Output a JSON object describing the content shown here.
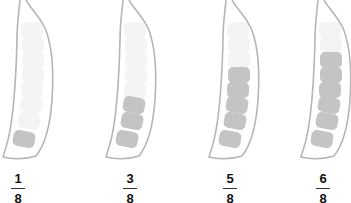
{
  "figure": {
    "colors": {
      "outline": "#b5b5b5",
      "filled_segment": "#c4c4c4",
      "empty_segment": "#f4f4f4",
      "label_text": "#111111"
    },
    "pods": [
      {
        "filled": 1,
        "total": 8,
        "numerator": "1",
        "denominator": "8",
        "offset_x": 0,
        "label_x": 8
      },
      {
        "filled": 3,
        "total": 8,
        "numerator": "3",
        "denominator": "8",
        "offset_x": 103,
        "label_x": 120
      },
      {
        "filled": 5,
        "total": 8,
        "numerator": "5",
        "denominator": "8",
        "offset_x": 206,
        "label_x": 220
      },
      {
        "filled": 6,
        "total": 8,
        "numerator": "6",
        "denominator": "8",
        "offset_x": 298,
        "label_x": 313
      }
    ]
  }
}
